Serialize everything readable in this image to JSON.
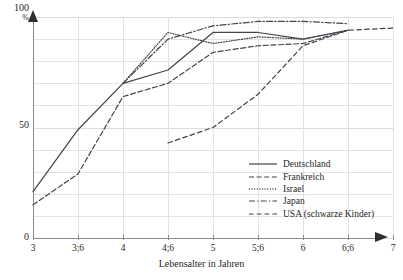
{
  "chart_data": {
    "type": "line",
    "title": "",
    "xlabel": "Lebensalter in Jahren",
    "ylabel": "%",
    "x": [
      3,
      3.5,
      4,
      4.5,
      5,
      5.5,
      6,
      6.5,
      7
    ],
    "categories": [
      "3",
      "3;6",
      "4",
      "4;6",
      "5",
      "5;6",
      "6",
      "6;6",
      "7"
    ],
    "xlim": [
      3,
      7
    ],
    "ylim": [
      0,
      100
    ],
    "yticks": [
      0,
      50,
      100
    ],
    "ytick_labels": [
      "0",
      "50",
      "100"
    ],
    "grid": true,
    "grid_step_y": 10,
    "legend_position": "inside-bottom-right",
    "series": [
      {
        "name": "Deutschland",
        "style": "solid",
        "x": [
          3,
          3.5,
          4,
          4.5,
          5,
          5.5,
          6,
          6.5
        ],
        "values": [
          21,
          49,
          70,
          76,
          93,
          93,
          90,
          94
        ]
      },
      {
        "name": "Frankreich",
        "style": "dashed",
        "x": [
          3,
          3.5,
          4,
          4.5,
          5,
          5.5,
          6,
          6.5
        ],
        "values": [
          15,
          29,
          64,
          70,
          84,
          87,
          88,
          94
        ]
      },
      {
        "name": "Israel",
        "style": "dotted",
        "x": [
          4,
          4.5,
          5,
          5.5,
          6,
          6.5
        ],
        "values": [
          70,
          93,
          88,
          91,
          90,
          94
        ]
      },
      {
        "name": "Japan",
        "style": "dash-dot",
        "x": [
          4,
          4.5,
          5,
          5.5,
          6,
          6.5
        ],
        "values": [
          70,
          90,
          96,
          98,
          98,
          97
        ]
      },
      {
        "name": "USA (schwarze Kinder)",
        "style": "long-dashed",
        "x": [
          4.5,
          5,
          5.5,
          6,
          6.5,
          7
        ],
        "values": [
          43,
          50,
          65,
          87,
          94,
          95
        ]
      }
    ]
  },
  "axes": {
    "y_top_label": "100",
    "y_unit_label": "%",
    "y_mid_label": "50",
    "y_zero_label": "0",
    "x_title": "Lebensalter in Jahren",
    "x_tick_labels": [
      "3",
      "3;6",
      "4",
      "4;6",
      "5",
      "5;6",
      "6",
      "6;6",
      "7"
    ]
  },
  "legend": {
    "items": [
      {
        "label": "Deutschland",
        "style": "solid"
      },
      {
        "label": "Frankreich",
        "style": "dashed"
      },
      {
        "label": "Israel",
        "style": "dotted"
      },
      {
        "label": "Japan",
        "style": "dash-dot"
      },
      {
        "label": "USA (schwarze Kinder)",
        "style": "long-dashed"
      }
    ]
  },
  "colors": {
    "line": "#43434a",
    "grid": "#e3e3e6",
    "axis": "#8a8a8e",
    "text": "#1f1f22",
    "background": "#ffffff"
  }
}
